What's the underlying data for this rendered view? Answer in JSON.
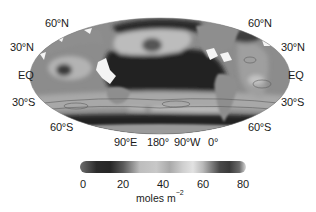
{
  "figure": {
    "type": "global ocean inventory map",
    "projection": "Mollweide-like equal-area",
    "lat_labels_left": [
      "60°N",
      "30°N",
      "EQ",
      "30°S",
      "60°S"
    ],
    "lat_labels_right": [
      "60°N",
      "30°N",
      "EQ",
      "30°S",
      "60°S"
    ],
    "lon_labels": [
      "90°E",
      "180°",
      "90°W",
      "0°"
    ],
    "colorbar": {
      "ticks": [
        "0",
        "20",
        "40",
        "60",
        "80"
      ],
      "range": [
        0,
        80
      ],
      "unit_base": "moles m",
      "unit_exp": "−2",
      "colormap": "grayscale (dark→light→dark, cyclic-like)"
    },
    "colors": {
      "land": "#8a8a8a",
      "ocean_low": "#222222",
      "ocean_high": "#d6d6d6",
      "background": "#ffffff",
      "text": "#1a1a1a"
    }
  }
}
